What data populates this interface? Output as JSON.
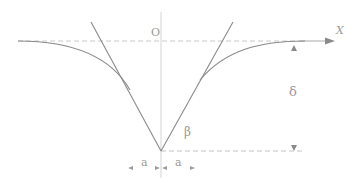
{
  "diagram": {
    "labels": {
      "origin": "O",
      "x_axis": "X",
      "depth": "δ",
      "angle": "β",
      "half_width_left": "a",
      "half_width_right": "a"
    },
    "colors": {
      "line": "#8a8a8a",
      "dashed": "#c4c4c4",
      "axis": "#cfcfcf",
      "text": "#9a9a9a"
    }
  }
}
